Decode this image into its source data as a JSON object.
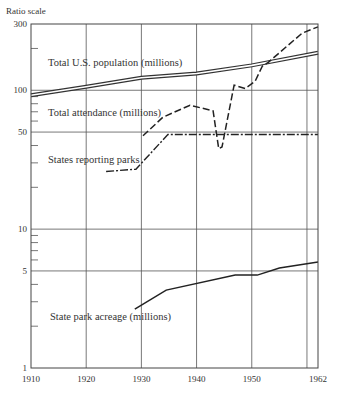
{
  "chart_data": {
    "type": "line",
    "title": "",
    "ylabel": "Ratio scale",
    "xlabel": "",
    "yscale": "log",
    "ylim": [
      1,
      300
    ],
    "xlim": [
      1910,
      1962
    ],
    "grid": true,
    "x_ticks": [
      1910,
      1920,
      1930,
      1940,
      1950,
      1962
    ],
    "x_tick_labels": [
      "1910",
      "1920",
      "1930",
      "1940",
      "1950",
      "1962"
    ],
    "y_ticks": [
      1,
      5,
      10,
      50,
      100,
      300
    ],
    "y_tick_labels": [
      "1",
      "5",
      "10",
      "50",
      "100",
      "300"
    ],
    "series": [
      {
        "name": "Total U.S. population (millions)",
        "style": "double-line",
        "x": [
          1910,
          1920,
          1930,
          1940,
          1950,
          1962
        ],
        "values": [
          92,
          106,
          123,
          132,
          151,
          186
        ]
      },
      {
        "name": "Total attendance (millions)",
        "style": "dashed",
        "x": [
          1930.3,
          1933.9,
          1938.8,
          1943,
          1944,
          1944.6,
          1946.8,
          1948.8,
          1950.6,
          1951.9,
          1953,
          1959.1,
          1960.9,
          1962
        ],
        "values": [
          47,
          64,
          78,
          71,
          38,
          39,
          109,
          103,
          116,
          149,
          159,
          257,
          275,
          286
        ]
      },
      {
        "name": "States reporting parks",
        "style": "dash-dot",
        "x": [
          1923.6,
          1929,
          1934.8,
          1962
        ],
        "values": [
          26,
          27,
          48,
          48
        ]
      },
      {
        "name": "State park acreage (millions)",
        "style": "solid",
        "x": [
          1928.8,
          1934.5,
          1947,
          1951,
          1955,
          1962
        ],
        "values": [
          2.65,
          3.64,
          4.67,
          4.67,
          5.24,
          5.79
        ]
      }
    ],
    "annotations": [
      "Total U.S. population (millions)",
      "Total attendance (millions)",
      "States reporting parks",
      "State park acreage (millions)"
    ]
  },
  "axis": {
    "ylabel": "Ratio scale"
  }
}
